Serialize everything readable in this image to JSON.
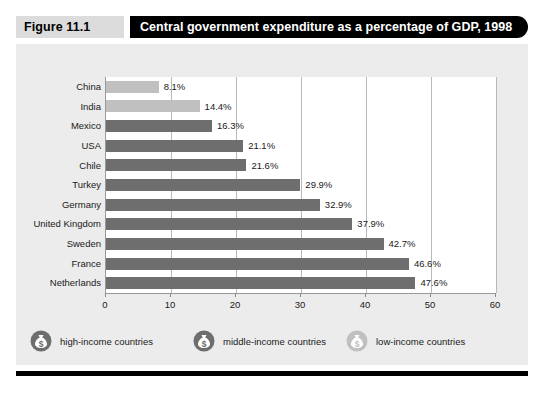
{
  "header": {
    "figure_number": "Figure 11.1",
    "title": "Central government expenditure as a percentage of GDP, 1998"
  },
  "colors": {
    "high_income_bar": "#6e6e6e",
    "low_income_bar": "#c0c0c0",
    "title_bar_bg": "#000000",
    "title_bar_text": "#ffffff",
    "figure_number_bg": "#dcdcdc",
    "card_bg": "#ececec",
    "plot_bg": "#ffffff",
    "gridline": "#b9b9b9"
  },
  "legend": {
    "items": [
      {
        "icon": "money-bag-icon",
        "label": "high-income countries",
        "shade": "#6e6e6e"
      },
      {
        "icon": "money-bag-icon",
        "label": "middle-income countries",
        "shade": "#6e6e6e"
      },
      {
        "icon": "money-bag-icon",
        "label": "low-income countries",
        "shade": "#c0c0c0"
      }
    ]
  },
  "chart_data": {
    "type": "bar",
    "orientation": "horizontal",
    "title": "Central government expenditure as a percentage of GDP, 1998",
    "xlabel": "",
    "ylabel": "",
    "xlim": [
      0,
      60
    ],
    "xticks": [
      0,
      10,
      20,
      30,
      40,
      50,
      60
    ],
    "xtick_labels": [
      "0",
      "10",
      "20",
      "30",
      "40",
      "50",
      "60"
    ],
    "grid": "vertical",
    "legend_position": "below",
    "categories": [
      "China",
      "India",
      "Mexico",
      "USA",
      "Chile",
      "Turkey",
      "Germany",
      "United Kingdom",
      "Sweden",
      "France",
      "Netherlands"
    ],
    "values": [
      8.1,
      14.4,
      16.3,
      21.1,
      21.6,
      29.9,
      32.9,
      37.9,
      42.7,
      46.6,
      47.6
    ],
    "value_labels": [
      "8.1%",
      "14.4%",
      "16.3%",
      "21.1%",
      "21.6%",
      "29.9%",
      "32.9%",
      "37.9%",
      "42.7%",
      "46.6%",
      "47.6%"
    ],
    "groups": [
      "low-income",
      "low-income",
      "middle-income",
      "high-income",
      "middle-income",
      "middle-income",
      "high-income",
      "high-income",
      "high-income",
      "high-income",
      "high-income"
    ],
    "bar_shades": [
      "#c0c0c0",
      "#c0c0c0",
      "#6e6e6e",
      "#6e6e6e",
      "#6e6e6e",
      "#6e6e6e",
      "#6e6e6e",
      "#6e6e6e",
      "#6e6e6e",
      "#6e6e6e",
      "#6e6e6e"
    ]
  }
}
